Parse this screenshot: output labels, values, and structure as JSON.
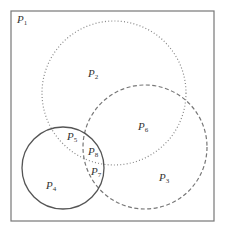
{
  "diagram": {
    "type": "venn",
    "frame": {
      "x": 11,
      "y": 11,
      "width": 203,
      "height": 210,
      "stroke": "#777777"
    },
    "circles": [
      {
        "name": "dotted-circle",
        "cx": 114,
        "cy": 93,
        "r": 72,
        "style": "dotted",
        "stroke": "#888888"
      },
      {
        "name": "dashed-circle",
        "cx": 145,
        "cy": 147,
        "r": 62,
        "style": "dashed",
        "stroke": "#777777"
      },
      {
        "name": "solid-circle",
        "cx": 63,
        "cy": 168,
        "r": 41,
        "style": "solid",
        "stroke": "#555555"
      }
    ],
    "regions": [
      {
        "id": "P1",
        "base": "P",
        "sub": "1",
        "x": 17,
        "y": 14
      },
      {
        "id": "P2",
        "base": "P",
        "sub": "2",
        "x": 88,
        "y": 68
      },
      {
        "id": "P6",
        "base": "P",
        "sub": "6",
        "x": 138,
        "y": 121
      },
      {
        "id": "P5",
        "base": "P",
        "sub": "5",
        "x": 67,
        "y": 131
      },
      {
        "id": "P8",
        "base": "P",
        "sub": "8",
        "x": 88,
        "y": 146
      },
      {
        "id": "P7",
        "base": "P",
        "sub": "7",
        "x": 91,
        "y": 166
      },
      {
        "id": "P3",
        "base": "P",
        "sub": "3",
        "x": 159,
        "y": 172
      },
      {
        "id": "P4",
        "base": "P",
        "sub": "4",
        "x": 46,
        "y": 180
      }
    ]
  }
}
